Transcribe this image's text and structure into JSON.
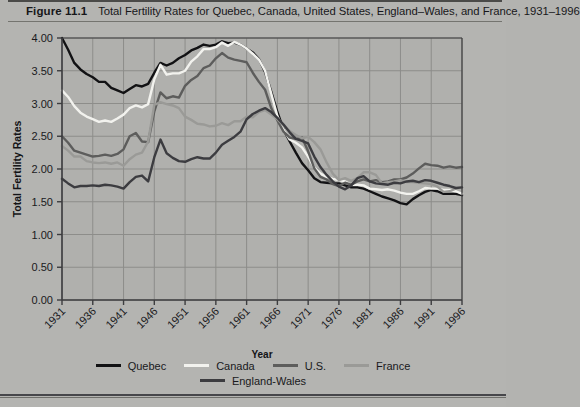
{
  "figure": {
    "number": "Figure 11.1",
    "caption": "Total Fertility Rates for Quebec, Canada, United States, England–Wales, and France, 1931–1996"
  },
  "colors": {
    "background": "#b4b4b1",
    "plot_background": "#b0b0ad",
    "grid": "#8d8d8a",
    "axis": "#3d3d3f",
    "quebec": "#121214",
    "canada": "#f2f2ee",
    "us": "#5d5d5c",
    "france": "#9a9a97",
    "england_wales": "#3c3c40"
  },
  "chart_data": {
    "type": "line",
    "title": "Total Fertility Rates for Quebec, Canada, United States, England–Wales, and France, 1931–1996",
    "xlabel": "Year",
    "ylabel": "Total Fertility Rates",
    "xlim": [
      1931,
      1996
    ],
    "ylim": [
      0.0,
      4.0
    ],
    "yticks": [
      "0.00",
      "0.50",
      "1.00",
      "1.50",
      "2.00",
      "2.50",
      "3.00",
      "3.50",
      "4.00"
    ],
    "ytick_values": [
      0.0,
      0.5,
      1.0,
      1.5,
      2.0,
      2.5,
      3.0,
      3.5,
      4.0
    ],
    "xticks": [
      "1931",
      "1936",
      "1941",
      "1946",
      "1951",
      "1956",
      "1961",
      "1966",
      "1971",
      "1976",
      "1981",
      "1986",
      "1991",
      "1996"
    ],
    "xtick_values": [
      1931,
      1936,
      1941,
      1946,
      1951,
      1956,
      1961,
      1966,
      1971,
      1976,
      1981,
      1986,
      1991,
      1996
    ],
    "grid": true,
    "legend_position": "bottom",
    "x": [
      1931,
      1932,
      1933,
      1934,
      1935,
      1936,
      1937,
      1938,
      1939,
      1940,
      1941,
      1942,
      1943,
      1944,
      1945,
      1946,
      1947,
      1948,
      1949,
      1950,
      1951,
      1952,
      1953,
      1954,
      1955,
      1956,
      1957,
      1958,
      1959,
      1960,
      1961,
      1962,
      1963,
      1964,
      1965,
      1966,
      1967,
      1968,
      1969,
      1970,
      1971,
      1972,
      1973,
      1974,
      1975,
      1976,
      1977,
      1978,
      1979,
      1980,
      1981,
      1982,
      1983,
      1984,
      1985,
      1986,
      1987,
      1988,
      1989,
      1990,
      1991,
      1992,
      1993,
      1994,
      1995,
      1996
    ],
    "series": [
      {
        "name": "Quebec",
        "color": "#121214",
        "values": [
          4.0,
          3.82,
          3.62,
          3.52,
          3.45,
          3.4,
          3.33,
          3.33,
          3.24,
          3.2,
          3.16,
          3.22,
          3.28,
          3.26,
          3.3,
          3.47,
          3.62,
          3.58,
          3.62,
          3.69,
          3.74,
          3.81,
          3.85,
          3.9,
          3.88,
          3.9,
          3.95,
          3.92,
          3.93,
          3.9,
          3.84,
          3.78,
          3.68,
          3.48,
          3.18,
          2.87,
          2.6,
          2.42,
          2.25,
          2.09,
          1.98,
          1.86,
          1.8,
          1.79,
          1.78,
          1.78,
          1.75,
          1.72,
          1.72,
          1.7,
          1.66,
          1.62,
          1.58,
          1.55,
          1.52,
          1.48,
          1.46,
          1.54,
          1.6,
          1.65,
          1.68,
          1.66,
          1.62,
          1.62,
          1.62,
          1.6
        ]
      },
      {
        "name": "Canada",
        "color": "#f2f2ee",
        "values": [
          3.2,
          3.1,
          2.96,
          2.86,
          2.8,
          2.76,
          2.72,
          2.74,
          2.72,
          2.77,
          2.83,
          2.93,
          2.97,
          2.94,
          2.99,
          3.37,
          3.59,
          3.44,
          3.46,
          3.46,
          3.5,
          3.64,
          3.72,
          3.83,
          3.83,
          3.86,
          3.93,
          3.88,
          3.94,
          3.9,
          3.84,
          3.76,
          3.67,
          3.5,
          3.15,
          2.81,
          2.6,
          2.45,
          2.4,
          2.33,
          2.19,
          2.02,
          1.93,
          1.88,
          1.85,
          1.83,
          1.81,
          1.76,
          1.76,
          1.75,
          1.7,
          1.69,
          1.68,
          1.69,
          1.67,
          1.64,
          1.62,
          1.62,
          1.66,
          1.71,
          1.7,
          1.7,
          1.68,
          1.68,
          1.66,
          1.62
        ]
      },
      {
        "name": "U.S.",
        "color": "#5d5d5c",
        "values": [
          2.5,
          2.4,
          2.28,
          2.25,
          2.22,
          2.19,
          2.2,
          2.22,
          2.2,
          2.23,
          2.3,
          2.5,
          2.55,
          2.42,
          2.41,
          2.88,
          3.17,
          3.08,
          3.11,
          3.09,
          3.27,
          3.36,
          3.42,
          3.54,
          3.58,
          3.69,
          3.77,
          3.7,
          3.67,
          3.65,
          3.63,
          3.47,
          3.33,
          3.21,
          2.93,
          2.74,
          2.57,
          2.48,
          2.46,
          2.48,
          2.27,
          2.01,
          1.88,
          1.84,
          1.77,
          1.74,
          1.79,
          1.76,
          1.81,
          1.84,
          1.81,
          1.83,
          1.8,
          1.81,
          1.84,
          1.84,
          1.87,
          1.93,
          2.01,
          2.08,
          2.06,
          2.05,
          2.02,
          2.04,
          2.02,
          2.03
        ]
      },
      {
        "name": "France",
        "color": "#9a9a97",
        "values": [
          2.35,
          2.28,
          2.19,
          2.19,
          2.12,
          2.1,
          2.09,
          2.1,
          2.08,
          2.1,
          2.05,
          2.15,
          2.22,
          2.25,
          2.42,
          2.98,
          3.02,
          2.99,
          2.97,
          2.93,
          2.8,
          2.75,
          2.69,
          2.68,
          2.65,
          2.66,
          2.7,
          2.67,
          2.73,
          2.73,
          2.8,
          2.79,
          2.87,
          2.9,
          2.83,
          2.76,
          2.66,
          2.58,
          2.52,
          2.47,
          2.49,
          2.41,
          2.3,
          2.1,
          1.93,
          1.83,
          1.86,
          1.82,
          1.86,
          1.95,
          1.95,
          1.91,
          1.78,
          1.8,
          1.81,
          1.83,
          1.8,
          1.8,
          1.79,
          1.78,
          1.77,
          1.73,
          1.65,
          1.66,
          1.7,
          1.72
        ]
      },
      {
        "name": "England-Wales",
        "color": "#3c3c40",
        "values": [
          1.85,
          1.78,
          1.72,
          1.74,
          1.74,
          1.75,
          1.74,
          1.76,
          1.75,
          1.73,
          1.7,
          1.8,
          1.88,
          1.9,
          1.81,
          2.18,
          2.45,
          2.24,
          2.17,
          2.12,
          2.11,
          2.15,
          2.18,
          2.16,
          2.16,
          2.25,
          2.37,
          2.43,
          2.49,
          2.57,
          2.76,
          2.84,
          2.89,
          2.93,
          2.87,
          2.78,
          2.68,
          2.56,
          2.46,
          2.43,
          2.39,
          2.19,
          2.03,
          1.91,
          1.81,
          1.73,
          1.69,
          1.75,
          1.86,
          1.89,
          1.81,
          1.78,
          1.77,
          1.76,
          1.79,
          1.78,
          1.81,
          1.82,
          1.8,
          1.83,
          1.82,
          1.79,
          1.76,
          1.74,
          1.71,
          1.72
        ]
      }
    ]
  },
  "legend": {
    "row1": [
      {
        "label": "Quebec",
        "color": "#121214"
      },
      {
        "label": "Canada",
        "color": "#f2f2ee"
      },
      {
        "label": "U.S.",
        "color": "#5d5d5c"
      },
      {
        "label": "France",
        "color": "#9a9a97"
      }
    ],
    "row2": [
      {
        "label": "England-Wales",
        "color": "#3c3c40"
      }
    ]
  }
}
